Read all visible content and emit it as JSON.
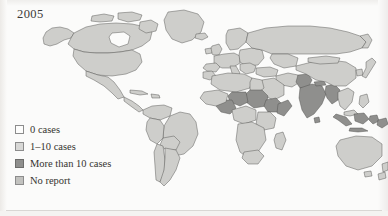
{
  "figure": {
    "year_label": "2005",
    "background_color": "#fbfbfa"
  },
  "legend": {
    "items": [
      {
        "label": "0 cases",
        "color": "#fdfdfc",
        "border": "#8c8c8c"
      },
      {
        "label": "1–10 cases",
        "color": "#d8d8d6",
        "border": "#8c8c8c"
      },
      {
        "label": "More than 10 cases",
        "color": "#8f8f8d",
        "border": "#6d6d6b"
      },
      {
        "label": "No report",
        "color": "#c2c2bf",
        "border": "#8c8c8c"
      }
    ]
  },
  "map": {
    "projection_note": "world",
    "colors": {
      "ocean": "#fbfbfa",
      "land_zero": "#fdfdfc",
      "land_low": "#cececb",
      "land_high": "#8f8f8d",
      "land_noreport": "#c2c2bf",
      "border_stroke": "#4f4e4c"
    },
    "regions": [
      {
        "name": "Greenland",
        "category": "1-10 cases"
      },
      {
        "name": "Canada",
        "category": "1-10 cases"
      },
      {
        "name": "Alaska",
        "category": "1-10 cases"
      },
      {
        "name": "United States",
        "category": "1-10 cases"
      },
      {
        "name": "Mexico",
        "category": "1-10 cases"
      },
      {
        "name": "Central America",
        "category": "1-10 cases"
      },
      {
        "name": "Caribbean",
        "category": "1-10 cases"
      },
      {
        "name": "Colombia",
        "category": "1-10 cases"
      },
      {
        "name": "Venezuela",
        "category": "1-10 cases"
      },
      {
        "name": "Brazil",
        "category": "1-10 cases"
      },
      {
        "name": "Peru",
        "category": "1-10 cases"
      },
      {
        "name": "Bolivia",
        "category": "1-10 cases"
      },
      {
        "name": "Chile",
        "category": "1-10 cases"
      },
      {
        "name": "Argentina",
        "category": "1-10 cases"
      },
      {
        "name": "United Kingdom",
        "category": "1-10 cases"
      },
      {
        "name": "Scandinavia",
        "category": "1-10 cases"
      },
      {
        "name": "Western Europe",
        "category": "1-10 cases"
      },
      {
        "name": "Eastern Europe",
        "category": "1-10 cases"
      },
      {
        "name": "Russia",
        "category": "1-10 cases"
      },
      {
        "name": "Turkey",
        "category": "1-10 cases"
      },
      {
        "name": "Morocco",
        "category": "1-10 cases"
      },
      {
        "name": "Algeria",
        "category": "1-10 cases"
      },
      {
        "name": "Libya",
        "category": "1-10 cases"
      },
      {
        "name": "Egypt",
        "category": "1-10 cases"
      },
      {
        "name": "Sudan",
        "category": "More than 10 cases"
      },
      {
        "name": "Ethiopia",
        "category": "More than 10 cases"
      },
      {
        "name": "Somalia",
        "category": "More than 10 cases"
      },
      {
        "name": "Nigeria",
        "category": "More than 10 cases"
      },
      {
        "name": "Niger",
        "category": "More than 10 cases"
      },
      {
        "name": "Chad",
        "category": "More than 10 cases"
      },
      {
        "name": "West Africa",
        "category": "1-10 cases"
      },
      {
        "name": "Central Africa",
        "category": "1-10 cases"
      },
      {
        "name": "Kenya",
        "category": "1-10 cases"
      },
      {
        "name": "Tanzania",
        "category": "1-10 cases"
      },
      {
        "name": "Angola",
        "category": "1-10 cases"
      },
      {
        "name": "South Africa",
        "category": "1-10 cases"
      },
      {
        "name": "Madagascar",
        "category": "1-10 cases"
      },
      {
        "name": "Saudi Arabia",
        "category": "1-10 cases"
      },
      {
        "name": "Iran",
        "category": "1-10 cases"
      },
      {
        "name": "Pakistan",
        "category": "More than 10 cases"
      },
      {
        "name": "India",
        "category": "More than 10 cases"
      },
      {
        "name": "Nepal",
        "category": "More than 10 cases"
      },
      {
        "name": "Bangladesh",
        "category": "More than 10 cases"
      },
      {
        "name": "Myanmar",
        "category": "More than 10 cases"
      },
      {
        "name": "China",
        "category": "1-10 cases"
      },
      {
        "name": "Mongolia",
        "category": "1-10 cases"
      },
      {
        "name": "Japan",
        "category": "1-10 cases"
      },
      {
        "name": "Korea",
        "category": "1-10 cases"
      },
      {
        "name": "Thailand",
        "category": "1-10 cases"
      },
      {
        "name": "Vietnam",
        "category": "1-10 cases"
      },
      {
        "name": "Philippines",
        "category": "1-10 cases"
      },
      {
        "name": "Indonesia",
        "category": "More than 10 cases"
      },
      {
        "name": "Papua New Guinea",
        "category": "More than 10 cases"
      },
      {
        "name": "Malaysia",
        "category": "1-10 cases"
      },
      {
        "name": "Australia",
        "category": "1-10 cases"
      },
      {
        "name": "New Zealand",
        "category": "1-10 cases"
      }
    ]
  }
}
